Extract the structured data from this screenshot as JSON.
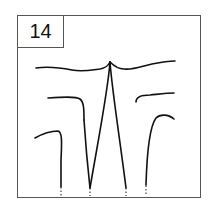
{
  "panel": {
    "label": "14"
  },
  "diagram": {
    "curve_count": 5,
    "stroke_color": "#111111",
    "frame_color": "#555555"
  }
}
